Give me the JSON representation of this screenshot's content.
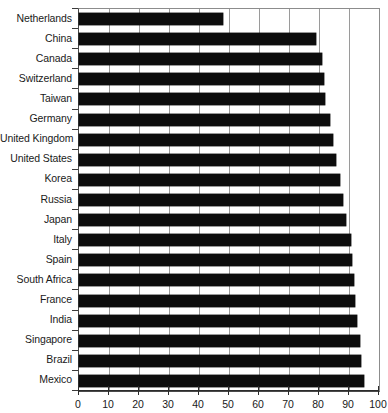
{
  "chart_data": {
    "type": "bar",
    "orientation": "horizontal",
    "title": "",
    "xlabel": "",
    "ylabel": "",
    "xlim": [
      0,
      100
    ],
    "xticks": [
      0,
      10,
      20,
      30,
      40,
      50,
      60,
      70,
      80,
      90,
      100
    ],
    "grid": true,
    "grid_axis": "x",
    "legend": false,
    "bar_color": "#0d0d0d",
    "categories": [
      "Netherlands",
      "China",
      "Canada",
      "Switzerland",
      "Taiwan",
      "Germany",
      "United Kingdom",
      "United States",
      "Korea",
      "Russia",
      "Japan",
      "Italy",
      "Spain",
      "South Africa",
      "France",
      "India",
      "Singapore",
      "Brazil",
      "Mexico"
    ],
    "values": [
      48,
      79,
      81,
      81.5,
      82,
      83.5,
      84.5,
      85.5,
      87,
      88,
      89,
      90.5,
      91,
      91.5,
      92,
      92.5,
      93.5,
      94,
      95
    ]
  }
}
